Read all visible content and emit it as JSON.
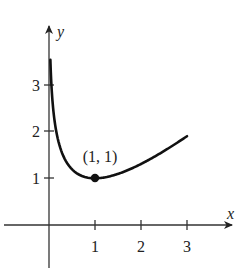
{
  "chart_data": {
    "type": "line",
    "title": "",
    "xlabel": "x",
    "ylabel": "y",
    "xlim": [
      -1,
      3.7
    ],
    "ylim": [
      -0.9,
      4.2
    ],
    "x_ticks": [
      1,
      2,
      3
    ],
    "x_tick_labels": [
      "1",
      "2",
      "3"
    ],
    "y_ticks": [
      1,
      2,
      3
    ],
    "y_tick_labels": [
      "1",
      "2",
      "3"
    ],
    "grid": false,
    "series": [
      {
        "name": "curve",
        "x": [
          0.03,
          0.05,
          0.1,
          0.2,
          0.3,
          0.5,
          0.7,
          1.0,
          1.5,
          2.0,
          2.5,
          3.0
        ],
        "y": [
          3.54,
          3.05,
          2.4,
          1.81,
          1.5,
          1.19,
          1.06,
          1.0,
          1.09,
          1.31,
          1.58,
          1.9
        ]
      }
    ],
    "annotations": [
      {
        "text": "(1, 1)",
        "x": 1,
        "y": 1,
        "marker": "filled-circle"
      }
    ]
  },
  "labels": {
    "x_axis": "x",
    "y_axis": "y",
    "x_ticks": [
      "1",
      "2",
      "3"
    ],
    "y_ticks": [
      "1",
      "2",
      "3"
    ],
    "point_label": "(1, 1)"
  }
}
